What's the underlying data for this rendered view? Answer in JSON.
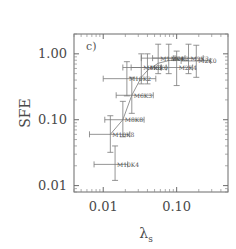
{
  "figure": {
    "panel_label": "c)",
    "background_color": "#ffffff",
    "ink_color": "#6b6b6b"
  },
  "chart_data": {
    "type": "scatter",
    "title": "",
    "subtitle": "",
    "panel": "c)",
    "xlabel": "λ",
    "xlabel_sub": "s",
    "ylabel": "SFE",
    "xscale": "log",
    "yscale": "log",
    "xlim": [
      0.004,
      0.5
    ],
    "ylim": [
      0.008,
      2.0
    ],
    "grid": false,
    "legend": null,
    "xticks": [
      0.01,
      0.1
    ],
    "xticklabels": [
      "0.01",
      "0.10"
    ],
    "yticks": [
      0.01,
      0.1,
      1.0
    ],
    "yticklabels": [
      "0.01",
      "0.10",
      "1.00"
    ],
    "points": [
      {
        "label": "M10K4",
        "x": 0.0145,
        "y": 0.021,
        "xerr_lo": 0.0075,
        "xerr_hi": 0.0215,
        "yerr_lo": 0.012,
        "yerr_hi": 0.04
      },
      {
        "label": "M10K8",
        "x": 0.0125,
        "y": 0.06,
        "xerr_lo": 0.0065,
        "xerr_hi": 0.023,
        "yerr_lo": 0.032,
        "yerr_hi": 0.115
      },
      {
        "label": "M8K8",
        "x": 0.0185,
        "y": 0.1,
        "xerr_lo": 0.0105,
        "xerr_hi": 0.036,
        "yerr_lo": 0.055,
        "yerr_hi": 0.19
      },
      {
        "label": "M6K3",
        "x": 0.0245,
        "y": 0.235,
        "xerr_lo": 0.015,
        "xerr_hi": 0.048,
        "yerr_lo": 0.125,
        "yerr_hi": 0.44
      },
      {
        "label": "M10K2",
        "x": 0.021,
        "y": 0.42,
        "xerr_lo": 0.01,
        "xerr_hi": 0.052,
        "yerr_lo": 0.23,
        "yerr_hi": 0.76
      },
      {
        "label": "M4K0",
        "x": 0.033,
        "y": 0.62,
        "xerr_lo": 0.0185,
        "xerr_hi": 0.061,
        "yerr_lo": 0.35,
        "yerr_hi": 1.0
      },
      {
        "label": "M6K0",
        "x": 0.04,
        "y": 0.62,
        "xerr_lo": 0.024,
        "xerr_hi": 0.072,
        "yerr_lo": 0.35,
        "yerr_hi": 1.0
      },
      {
        "label": "M1.2K4",
        "x": 0.056,
        "y": 0.86,
        "xerr_lo": 0.033,
        "xerr_hi": 0.095,
        "yerr_lo": 0.5,
        "yerr_hi": 1.4
      },
      {
        "label": "M2K2",
        "x": 0.078,
        "y": 0.86,
        "xerr_lo": 0.047,
        "xerr_hi": 0.13,
        "yerr_lo": 0.5,
        "yerr_hi": 1.4
      },
      {
        "label": "M2K4",
        "x": 0.1,
        "y": 0.62,
        "xerr_lo": 0.062,
        "xerr_hi": 0.165,
        "yerr_lo": 0.33,
        "yerr_hi": 1.1
      },
      {
        "label": "M2K3",
        "x": 0.145,
        "y": 0.86,
        "xerr_lo": 0.09,
        "xerr_hi": 0.23,
        "yerr_lo": 0.5,
        "yerr_hi": 1.4
      },
      {
        "label": "M2K0",
        "x": 0.185,
        "y": 0.78,
        "xerr_lo": 0.115,
        "xerr_hi": 0.29,
        "yerr_lo": 0.44,
        "yerr_hi": 1.35
      }
    ],
    "curve": [
      {
        "x": 0.0125,
        "y": 0.06
      },
      {
        "x": 0.0185,
        "y": 0.1
      },
      {
        "x": 0.0245,
        "y": 0.235
      },
      {
        "x": 0.033,
        "y": 0.44
      },
      {
        "x": 0.04,
        "y": 0.56
      },
      {
        "x": 0.056,
        "y": 0.72
      },
      {
        "x": 0.078,
        "y": 0.79
      },
      {
        "x": 0.1,
        "y": 0.82
      },
      {
        "x": 0.145,
        "y": 0.85
      },
      {
        "x": 0.185,
        "y": 0.86
      }
    ]
  }
}
